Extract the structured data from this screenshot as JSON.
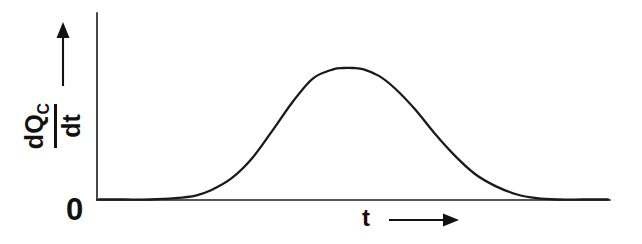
{
  "figure": {
    "background_color": "#ffffff",
    "ink_color": "#1a1a1a",
    "width": 642,
    "height": 244
  },
  "axes": {
    "origin_label": "0",
    "x_axis": {
      "label": "t",
      "arrow_icon": "right-arrow-icon",
      "has_arrowhead_on_axis_line": false
    },
    "y_axis": {
      "label_numerator": "dQ",
      "label_numerator_subscript": "C",
      "label_denominator": "dt",
      "label_plain": "dQ_C/dt",
      "arrow_icon": "up-arrow-icon",
      "has_arrowhead_on_axis_line": false
    }
  },
  "chart_data": {
    "type": "line",
    "title": "",
    "xlabel": "t",
    "ylabel": "dQ_C/dt",
    "grid": false,
    "legend": false,
    "annotations": [],
    "tick_labels": {
      "x": [],
      "y": [
        "0"
      ]
    },
    "axis_ranges": {
      "xlim": [
        0,
        1
      ],
      "ylim": [
        0,
        1
      ]
    },
    "series": [
      {
        "name": "dQ_C/dt",
        "x": [
          0.0,
          0.05,
          0.1,
          0.15,
          0.19,
          0.22,
          0.26,
          0.3,
          0.34,
          0.38,
          0.42,
          0.46,
          0.48,
          0.5,
          0.52,
          0.55,
          0.58,
          0.62,
          0.66,
          0.7,
          0.74,
          0.78,
          0.82,
          0.86,
          0.9,
          0.95,
          1.0
        ],
        "y": [
          0.0,
          0.0,
          0.0,
          0.01,
          0.03,
          0.07,
          0.16,
          0.31,
          0.52,
          0.74,
          0.92,
          0.99,
          1.0,
          1.0,
          0.99,
          0.94,
          0.85,
          0.69,
          0.5,
          0.33,
          0.19,
          0.1,
          0.04,
          0.01,
          0.0,
          0.0,
          0.0
        ]
      }
    ]
  }
}
